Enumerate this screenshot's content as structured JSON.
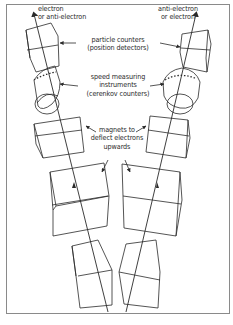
{
  "diagram": {
    "labels": {
      "left_beam": [
        "electron",
        "or anti-electron"
      ],
      "right_beam": [
        "anti-electron",
        "or electron"
      ],
      "particle_counters": [
        "particle counters",
        "(position detectors)"
      ],
      "speed_instruments": [
        "speed measuring",
        "instruments",
        "(cerenkov counters)"
      ],
      "magnets": [
        "magnets to",
        "deflect electrons",
        "upwards"
      ]
    },
    "components": [
      {
        "name": "particle-counter",
        "count": 2
      },
      {
        "name": "cerenkov-counter",
        "count": 2
      },
      {
        "name": "magnet-upper",
        "count": 2
      },
      {
        "name": "magnet-middle",
        "count": 2
      },
      {
        "name": "magnet-lower",
        "count": 2
      }
    ],
    "colors": {
      "line": "#2a2a2a",
      "frame": "#8a8a8a",
      "background": "#ffffff"
    }
  }
}
